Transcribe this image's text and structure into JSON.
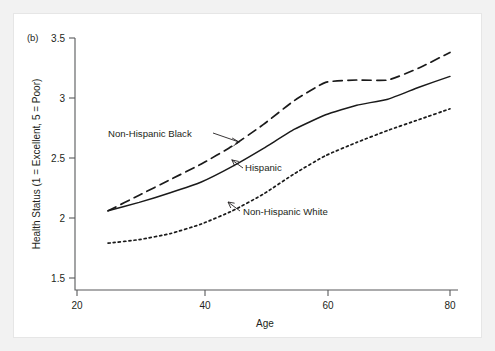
{
  "figure": {
    "panel_label": "(b)",
    "background_color": "#f2f2f2",
    "plot_background_color": "#ffffff",
    "line_color": "#1a1a1a",
    "axis_color": "#58595b"
  },
  "chart_data": {
    "type": "line",
    "title": "",
    "subtitle": "",
    "xlabel": "Age",
    "ylabel": "Health Status (1 = Excellent, 5 = Poor)",
    "xlim": [
      20,
      80
    ],
    "ylim": [
      1.5,
      3.5
    ],
    "xticks": [
      20,
      40,
      60,
      80
    ],
    "yticks": [
      1.5,
      2,
      2.5,
      3,
      3.5
    ],
    "xtick_labels": [
      "20",
      "40",
      "60",
      "80"
    ],
    "ytick_labels": [
      "1.5",
      "2",
      "2.5",
      "3",
      "3.5"
    ],
    "grid": false,
    "legend_position": "inline-annotations",
    "x": [
      25,
      30,
      35,
      40,
      45,
      50,
      55,
      60,
      65,
      70,
      75,
      80
    ],
    "series": [
      {
        "name": "Non-Hispanic Black",
        "line_style": "dashed",
        "values": [
          2.06,
          2.19,
          2.32,
          2.45,
          2.6,
          2.78,
          2.98,
          3.13,
          3.15,
          3.15,
          3.25,
          3.38
        ]
      },
      {
        "name": "Hispanic",
        "line_style": "solid",
        "values": [
          2.06,
          2.13,
          2.21,
          2.3,
          2.43,
          2.58,
          2.74,
          2.86,
          2.94,
          2.99,
          3.09,
          3.18
        ]
      },
      {
        "name": "Non-Hispanic White",
        "line_style": "dotted",
        "values": [
          1.79,
          1.82,
          1.87,
          1.95,
          2.06,
          2.2,
          2.37,
          2.52,
          2.63,
          2.73,
          2.82,
          2.91
        ]
      }
    ],
    "annotations": [
      {
        "text": "Non-Hispanic Black",
        "series": "Non-Hispanic Black"
      },
      {
        "text": "Hispanic",
        "series": "Hispanic"
      },
      {
        "text": "Non-Hispanic White",
        "series": "Non-Hispanic White"
      }
    ]
  }
}
